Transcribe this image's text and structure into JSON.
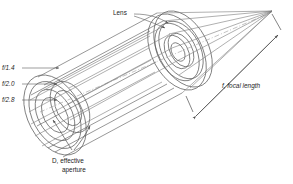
{
  "diagram": {
    "background_color": "#ffffff",
    "line_color": "#6b6b6b",
    "text_color": "#1d1d1d",
    "labels": {
      "lens": "Lens",
      "fstop_1": "f/1.4",
      "fstop_2": "f/2.0",
      "fstop_3": "f/2.8",
      "aperture_line1": "D, effective",
      "aperture_line2": "aperture",
      "focal_length": "f, focal length"
    },
    "fstops": [
      {
        "id": "f14",
        "label": "f/1.4",
        "ring_index": 0
      },
      {
        "id": "f20",
        "label": "f/2.0",
        "ring_index": 1
      },
      {
        "id": "f28",
        "label": "f/2.8",
        "ring_index": 2
      }
    ],
    "annotations": [
      {
        "name": "lens-callout",
        "text": "Lens"
      },
      {
        "name": "aperture-dimension",
        "text": "D, effective aperture"
      },
      {
        "name": "focal-length-dimension",
        "text": "f, focal length"
      }
    ]
  }
}
